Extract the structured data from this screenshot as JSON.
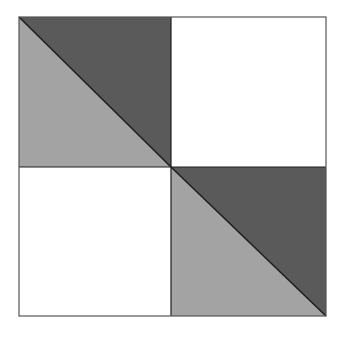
{
  "diagram": {
    "title": "",
    "type": "quilt-block-half-square-triangles",
    "grid": {
      "rows": 2,
      "cols": 2
    },
    "bounds": {
      "x1": 19,
      "y1": 17,
      "x2": 326,
      "y2": 316
    },
    "center": {
      "x": 171,
      "y": 167
    },
    "colors": {
      "dark": "#5a5a5a",
      "light": "#a3a3a3",
      "blank": "#ffffff",
      "stroke": "#1e1e1e",
      "outline": "#555555"
    },
    "quadrants": [
      {
        "position": "top-left",
        "fill": "split-diagonal",
        "upper_right": "dark",
        "lower_left": "light"
      },
      {
        "position": "top-right",
        "fill": "blank"
      },
      {
        "position": "bottom-left",
        "fill": "blank"
      },
      {
        "position": "bottom-right",
        "fill": "split-diagonal",
        "upper_right": "dark",
        "lower_left": "light"
      }
    ]
  }
}
